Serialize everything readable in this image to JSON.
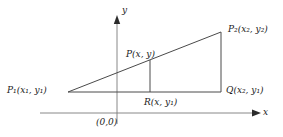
{
  "figure": {
    "type": "coordinate-geometry-diagram",
    "background_color": "#ffffff",
    "line_color": "#444444",
    "axis_color": "#777777",
    "text_color": "#1a1a1a"
  },
  "axes": {
    "x_label": "x",
    "y_label": "y",
    "origin_label": "(0,0)",
    "x_axis": {
      "x1": 40,
      "y1": 113,
      "x2": 258,
      "y2": 113,
      "arrow": "right"
    },
    "y_axis": {
      "x1": 117,
      "y1": 122,
      "x2": 117,
      "y2": 18,
      "arrow": "up"
    }
  },
  "points": {
    "p1": {
      "name": "P1",
      "label_main": "P",
      "label_sub": "1",
      "label_coords": "(x",
      "coord_sub1": "1",
      "coord_mid": ", y",
      "coord_sub2": "1",
      "coord_close": ")",
      "full_label": "P₁(x₁, y₁)",
      "x": 68,
      "y": 92
    },
    "p2": {
      "name": "P2",
      "full_label": "P₂(x₂, y₂)",
      "x": 221,
      "y": 32
    },
    "p": {
      "name": "P",
      "full_label": "P(x, y)",
      "x": 150,
      "y": 60
    },
    "q": {
      "name": "Q",
      "full_label": "Q(x₂, y₁)",
      "x": 221,
      "y": 92
    },
    "r": {
      "name": "R",
      "full_label": "R(x, y₁)",
      "x": 150,
      "y": 92
    }
  },
  "segments": [
    {
      "name": "hypotenuse-p1-p2",
      "x1": 68,
      "y1": 92,
      "x2": 221,
      "y2": 32
    },
    {
      "name": "base-p1-q",
      "x1": 68,
      "y1": 92,
      "x2": 221,
      "y2": 92
    },
    {
      "name": "vertical-p2-q",
      "x1": 221,
      "y1": 32,
      "x2": 221,
      "y2": 92
    },
    {
      "name": "vertical-p-r",
      "x1": 150,
      "y1": 60,
      "x2": 150,
      "y2": 92
    }
  ]
}
